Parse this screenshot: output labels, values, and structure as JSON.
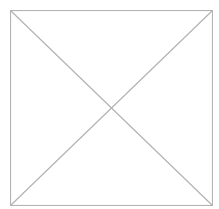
{
  "placeholder": {
    "icon": "broken-image-placeholder-icon",
    "stroke_color": "#b3b3b3",
    "background_color": "#ffffff"
  }
}
